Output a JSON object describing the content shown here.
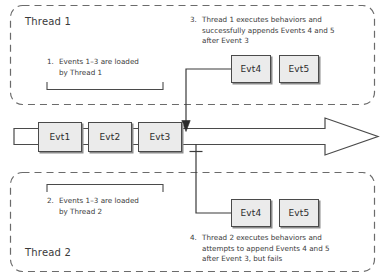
{
  "diagram": {
    "colors": {
      "stroke": "#4a4a4a",
      "box_fill": "#ebebeb",
      "text": "#3a3a3a",
      "shadow": "#8c8c8c",
      "background": "#ffffff"
    }
  },
  "thread1": {
    "label": "Thread 1",
    "note_load": {
      "number": "1.",
      "lines": [
        "Events 1–3 are loaded",
        "by Thread 1"
      ]
    },
    "note_append": {
      "number": "3.",
      "lines": [
        "Thread 1 executes behaviors and",
        "successfully appends Events 4 and 5",
        "after Event 3"
      ]
    },
    "events": [
      {
        "label": "Evt4"
      },
      {
        "label": "Evt5"
      }
    ]
  },
  "thread2": {
    "label": "Thread 2",
    "note_load": {
      "number": "2.",
      "lines": [
        "Events 1–3 are loaded",
        "by Thread 2"
      ]
    },
    "note_append": {
      "number": "4.",
      "lines": [
        "Thread 2 executes behaviors and",
        "attempts to append Events 4 and 5",
        "after Event 3, but fails"
      ]
    },
    "events": [
      {
        "label": "Evt4"
      },
      {
        "label": "Evt5"
      }
    ]
  },
  "stream": {
    "name": "event-stream-timeline",
    "events": [
      {
        "label": "Evt1"
      },
      {
        "label": "Evt2"
      },
      {
        "label": "Evt3"
      }
    ]
  }
}
